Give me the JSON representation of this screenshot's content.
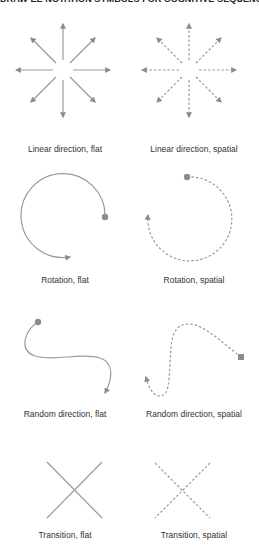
{
  "title": "DRAW EE NOTATION SYMBOLS FOR COGNITIVE SEQUENCE",
  "colors": {
    "stroke": "#8c8c8c",
    "text": "#333333",
    "background": "#ffffff"
  },
  "symbols": [
    {
      "label": "Linear direction, flat",
      "icon": "radial-arrows-solid-icon"
    },
    {
      "label": "Linear direction, spatial",
      "icon": "radial-arrows-dashed-icon"
    },
    {
      "label": "Rotation, flat",
      "icon": "rotation-arc-solid-icon"
    },
    {
      "label": "Rotation, spatial",
      "icon": "rotation-arc-dashed-icon"
    },
    {
      "label": "Random direction, flat",
      "icon": "random-curve-solid-icon"
    },
    {
      "label": "Random direction, spatial",
      "icon": "random-curve-dashed-icon"
    },
    {
      "label": "Transition, flat",
      "icon": "cross-solid-icon"
    },
    {
      "label": "Transition, spatial",
      "icon": "cross-dashed-icon"
    }
  ]
}
